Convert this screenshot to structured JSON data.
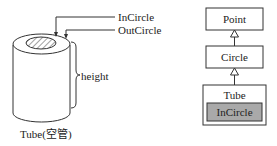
{
  "left_figure": {
    "labels": {
      "incircle": "InCircle",
      "outcircle": "OutCircle",
      "height": "height",
      "caption": "Tube(空管)"
    }
  },
  "right_figure": {
    "classes": {
      "point": "Point",
      "circle": "Circle",
      "tube": "Tube",
      "incircle": "InCircle"
    },
    "relation": "inheritance",
    "colors": {
      "incircle_fill": "#a9a9a9",
      "box_fill": "#ffffff",
      "stroke": "#333333"
    }
  }
}
